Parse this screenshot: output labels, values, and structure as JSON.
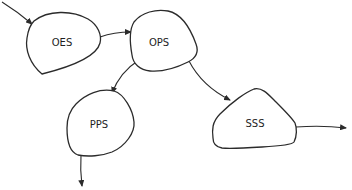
{
  "diagram": {
    "type": "state-flow",
    "nodes": [
      {
        "id": "oes",
        "label": "OES"
      },
      {
        "id": "ops",
        "label": "OPS"
      },
      {
        "id": "pps",
        "label": "PPS"
      },
      {
        "id": "sss",
        "label": "SSS"
      }
    ],
    "edges": [
      {
        "from": "(external)",
        "to": "OES"
      },
      {
        "from": "OES",
        "to": "OPS"
      },
      {
        "from": "OPS",
        "to": "PPS"
      },
      {
        "from": "OPS",
        "to": "SSS"
      },
      {
        "from": "PPS",
        "to": "(external)"
      },
      {
        "from": "SSS",
        "to": "(external)"
      }
    ],
    "colors": {
      "stroke": "#2b2b2b",
      "background": "#ffffff",
      "text": "#1e1e1e"
    }
  }
}
